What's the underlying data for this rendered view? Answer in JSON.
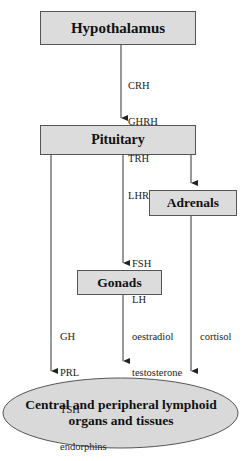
{
  "diagram": {
    "nodes": {
      "hypothalamus": "Hypothalamus",
      "pituitary": "Pituitary",
      "adrenals": "Adrenals",
      "gonads": "Gonads",
      "target_line1": "Central and peripheral lymphoid",
      "target_line2": "organs and tissues"
    },
    "edges": {
      "hypothalamus_to_pituitary": [
        "CRH",
        "GHRH",
        "TRH",
        "LHRH"
      ],
      "pituitary_to_adrenals": [
        "ACTH"
      ],
      "pituitary_to_gonads": [
        "FSH",
        "LH"
      ],
      "pituitary_to_target": [
        "GH",
        "PRL",
        "TSH",
        "endorphins"
      ],
      "gonads_to_target": [
        "oestradiol",
        "testosterone"
      ],
      "adrenals_to_target": [
        "cortisol"
      ]
    },
    "colors": {
      "box_fill": "#dcdcdc",
      "ellipse_fill": "#d9d9d9",
      "line": "#333333"
    }
  }
}
